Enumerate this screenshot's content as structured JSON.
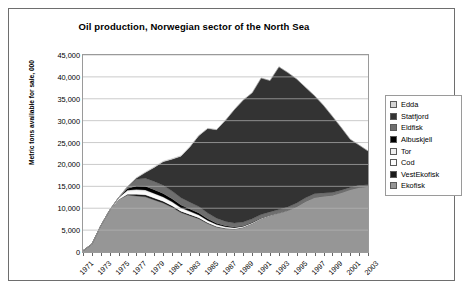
{
  "chart_data": {
    "type": "area",
    "stacked": true,
    "title": "Oil production, Norwegian sector of the North Sea",
    "xlabel": "",
    "ylabel": "Metric tons available for sale, 000",
    "ylim": [
      0,
      45000
    ],
    "ytick_labels": [
      "0",
      "5,000",
      "10,000",
      "15,000",
      "20,000",
      "25,000",
      "30,000",
      "35,000",
      "40,000",
      "45,000"
    ],
    "ytick_values": [
      0,
      5000,
      10000,
      15000,
      20000,
      25000,
      30000,
      35000,
      40000,
      45000
    ],
    "grid": true,
    "legend_position": "right",
    "x": [
      1971,
      1972,
      1973,
      1974,
      1975,
      1976,
      1977,
      1978,
      1979,
      1980,
      1981,
      1982,
      1983,
      1984,
      1985,
      1986,
      1987,
      1988,
      1989,
      1990,
      1991,
      1992,
      1993,
      1994,
      1995,
      1996,
      1997,
      1998,
      1999,
      2000,
      2001,
      2002,
      2003
    ],
    "xtick_labels": [
      "1971",
      "1973",
      "1975",
      "1977",
      "1979",
      "1981",
      "1983",
      "1985",
      "1987",
      "1989",
      "1991",
      "1993",
      "1995",
      "1997",
      "1999",
      "2001",
      "2003"
    ],
    "series": [
      {
        "name": "Ekofisk",
        "color": "#969696",
        "values": [
          300,
          1800,
          6000,
          9500,
          12000,
          13000,
          12800,
          12600,
          11900,
          11200,
          10200,
          9000,
          8300,
          7600,
          6500,
          5700,
          5300,
          5200,
          5600,
          6500,
          7600,
          8300,
          8900,
          9500,
          10400,
          11600,
          12500,
          12800,
          13000,
          13600,
          14300,
          14800,
          15000
        ]
      },
      {
        "name": "VestEkofisk",
        "color": "#1a1a1a",
        "values": [
          0,
          0,
          0,
          0,
          0,
          200,
          420,
          460,
          430,
          400,
          360,
          320,
          280,
          240,
          190,
          140,
          100,
          70,
          40,
          20,
          10,
          0,
          0,
          0,
          0,
          0,
          0,
          0,
          0,
          0,
          0,
          0,
          0
        ]
      },
      {
        "name": "Cod",
        "color": "#fcfcfc",
        "values": [
          0,
          0,
          0,
          60,
          300,
          620,
          700,
          720,
          700,
          660,
          600,
          540,
          480,
          420,
          360,
          300,
          250,
          200,
          160,
          120,
          90,
          60,
          40,
          20,
          10,
          0,
          0,
          0,
          0,
          0,
          0,
          0,
          0
        ]
      },
      {
        "name": "Tor",
        "color": "#f0f0f0",
        "values": [
          0,
          0,
          0,
          0,
          120,
          300,
          360,
          380,
          360,
          330,
          300,
          260,
          230,
          200,
          170,
          140,
          110,
          90,
          70,
          50,
          30,
          20,
          10,
          0,
          0,
          0,
          0,
          0,
          0,
          0,
          0,
          0,
          0
        ]
      },
      {
        "name": "Albuskjell",
        "color": "#000000",
        "values": [
          0,
          0,
          0,
          0,
          0,
          400,
          820,
          880,
          840,
          780,
          700,
          620,
          540,
          460,
          380,
          300,
          230,
          170,
          120,
          80,
          40,
          20,
          0,
          0,
          0,
          0,
          0,
          0,
          0,
          0,
          0,
          0,
          0
        ]
      },
      {
        "name": "Eldfisk",
        "color": "#6e6e6e",
        "values": [
          0,
          0,
          0,
          0,
          0,
          400,
          1500,
          1800,
          1900,
          1850,
          1750,
          1650,
          1550,
          1450,
          1300,
          1150,
          1000,
          900,
          850,
          800,
          780,
          760,
          750,
          760,
          780,
          800,
          820,
          700,
          600,
          520,
          460,
          420,
          380
        ]
      },
      {
        "name": "Statfjord",
        "color": "#333333",
        "values": [
          0,
          0,
          0,
          0,
          0,
          0,
          300,
          1300,
          3200,
          5400,
          7300,
          9500,
          12600,
          16200,
          19300,
          20200,
          23100,
          25900,
          27900,
          28800,
          31200,
          30000,
          32600,
          30700,
          28300,
          25200,
          22400,
          20000,
          17400,
          14300,
          11000,
          9200,
          7700
        ]
      },
      {
        "name": "Edda",
        "color": "#d4d4d4",
        "values": [
          0,
          0,
          0,
          0,
          0,
          0,
          100,
          160,
          170,
          160,
          150,
          140,
          120,
          100,
          80,
          60,
          50,
          40,
          30,
          20,
          10,
          0,
          0,
          0,
          0,
          0,
          0,
          0,
          0,
          0,
          0,
          0,
          0
        ]
      }
    ],
    "legend_entries": [
      {
        "label": "Edda",
        "color": "#d4d4d4"
      },
      {
        "label": "Statfjord",
        "color": "#333333"
      },
      {
        "label": "Eldfisk",
        "color": "#6e6e6e"
      },
      {
        "label": "Albuskjell",
        "color": "#000000"
      },
      {
        "label": "Tor",
        "color": "#f0f0f0"
      },
      {
        "label": "Cod",
        "color": "#fcfcfc"
      },
      {
        "label": "VestEkofisk",
        "color": "#1a1a1a"
      },
      {
        "label": "Ekofisk",
        "color": "#969696"
      }
    ]
  }
}
